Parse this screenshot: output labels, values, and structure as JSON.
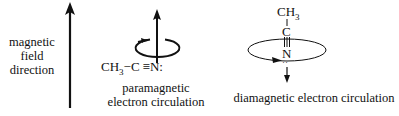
{
  "field_label": {
    "line1": "magnetic",
    "line2": "field",
    "line3": "direction"
  },
  "paramagnetic": {
    "formula_prefix": "CH",
    "formula_sub": "3",
    "formula_bond": "−C",
    "formula_triple": "≡",
    "formula_n": "N:",
    "label_line1": "paramagnetic",
    "label_line2": "electron circulation"
  },
  "diamagnetic": {
    "top_group": "CH",
    "top_sub": "3",
    "carbon": "C",
    "nitrogen": "N",
    "lone_pair": "··",
    "label": "diamagnetic electron circulation"
  },
  "icons": {
    "field_arrow": "arrow-up",
    "para_induced_field": "arrow-up",
    "dia_induced_field": "arrow-down"
  }
}
